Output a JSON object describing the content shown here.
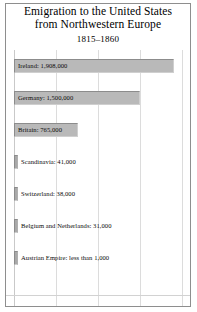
{
  "figure": {
    "title_line_1": "Emigration to the United States",
    "title_line_2": "from Northwestern Europe",
    "subtitle": "1815–1860",
    "frame_color": "#8e8e8e",
    "bar_fill_color": "#b9b9b9",
    "bar_edge_color": "#8c8c8c",
    "gridline_color": "#dcdcdc",
    "background_color": "#ffffff"
  },
  "chart_data": {
    "type": "bar",
    "orientation": "horizontal",
    "title": "Emigration to the United States from Northwestern Europe",
    "subtitle": "1815–1860",
    "xlabel": "",
    "ylabel": "",
    "xlim": [
      0,
      2000000
    ],
    "grid": true,
    "gridlines_x": [
      0,
      500000,
      1000000,
      1500000,
      2000000
    ],
    "legend": "none",
    "categories": [
      "Ireland",
      "Germany",
      "Britain",
      "Scandinavia",
      "Switzerland",
      "Belgium and Netherlands",
      "Austrian Empire"
    ],
    "values": [
      1908000,
      1500000,
      765000,
      41000,
      38000,
      31000,
      1000
    ],
    "bars": [
      {
        "category": "Ireland",
        "value": 1908000,
        "value_text": "1,908,000",
        "label": "Ireland: 1,908,000",
        "label_position": "inside"
      },
      {
        "category": "Germany",
        "value": 1500000,
        "value_text": "1,500,000",
        "label": "Germany: 1,500,000",
        "label_position": "inside"
      },
      {
        "category": "Britain",
        "value": 765000,
        "value_text": "765,000",
        "label": "Britain: 765,000",
        "label_position": "inside"
      },
      {
        "category": "Scandinavia",
        "value": 41000,
        "value_text": "41,000",
        "label": "Scandinavia: 41,000",
        "label_position": "outside"
      },
      {
        "category": "Switzerland",
        "value": 38000,
        "value_text": "38,000",
        "label": "Switzerland: 38,000",
        "label_position": "outside"
      },
      {
        "category": "Belgium and Netherlands",
        "value": 31000,
        "value_text": "31,000",
        "label": "Belgium and Netherlands: 31,000",
        "label_position": "outside"
      },
      {
        "category": "Austrian Empire",
        "value": 1000,
        "value_text": "less than 1,000",
        "label": "Austrian Empire: less than 1,000",
        "label_position": "outside"
      }
    ]
  }
}
